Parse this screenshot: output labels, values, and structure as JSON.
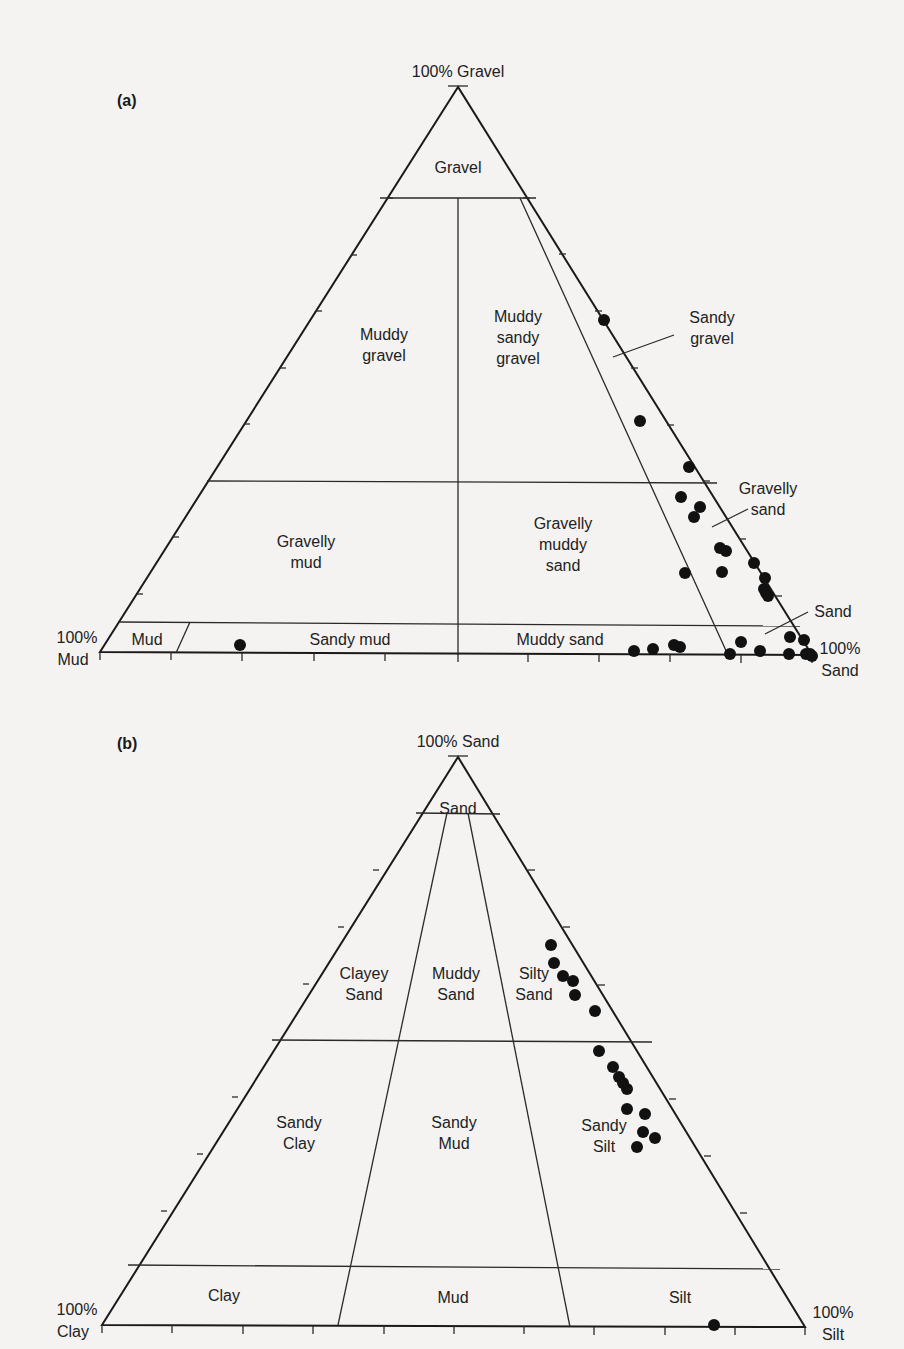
{
  "chart_data": [
    {
      "type": "ternary",
      "panel": "(a)",
      "title": "",
      "vertices": {
        "top": "100% Gravel",
        "bottom_left": [
          "100%",
          "Mud"
        ],
        "bottom_right": [
          "100%",
          "Sand"
        ]
      },
      "geometry": {
        "apex": [
          458,
          87
        ],
        "left": [
          100,
          652
        ],
        "right": [
          812,
          655
        ]
      },
      "boundaries_gravel_pct": [
        80,
        30,
        5
      ],
      "regions": [
        {
          "lines": [
            "Gravel"
          ],
          "x": 458,
          "y": 168
        },
        {
          "lines": [
            "Muddy",
            "gravel"
          ],
          "x": 384,
          "y": 345
        },
        {
          "lines": [
            "Muddy",
            "sandy",
            "gravel"
          ],
          "x": 518,
          "y": 338
        },
        {
          "lines": [
            "Sandy",
            "gravel"
          ],
          "x": 712,
          "y": 328,
          "leader": [
            [
              613,
              357
            ],
            [
              674,
              335
            ]
          ]
        },
        {
          "lines": [
            "Gravelly",
            "mud"
          ],
          "x": 306,
          "y": 552
        },
        {
          "lines": [
            "Gravelly",
            "muddy",
            "sand"
          ],
          "x": 563,
          "y": 545
        },
        {
          "lines": [
            "Gravelly",
            "sand"
          ],
          "x": 768,
          "y": 499,
          "leader": [
            [
              712,
              527
            ],
            [
              748,
              509
            ]
          ]
        },
        {
          "lines": [
            "Sand"
          ],
          "x": 833,
          "y": 612,
          "leader": [
            [
              765,
              634
            ],
            [
              808,
              612
            ]
          ]
        },
        {
          "lines": [
            "Mud"
          ],
          "x": 147,
          "y": 640
        },
        {
          "lines": [
            "Sandy mud"
          ],
          "x": 350,
          "y": 640
        },
        {
          "lines": [
            "Muddy sand"
          ],
          "x": 560,
          "y": 640
        }
      ],
      "points": [
        [
          604,
          320
        ],
        [
          640,
          421
        ],
        [
          689,
          467
        ],
        [
          681,
          497
        ],
        [
          700,
          507
        ],
        [
          694,
          517
        ],
        [
          720,
          548
        ],
        [
          726,
          551
        ],
        [
          685,
          573
        ],
        [
          722,
          572
        ],
        [
          754,
          563
        ],
        [
          765,
          578
        ],
        [
          764,
          589
        ],
        [
          766,
          593
        ],
        [
          768,
          596
        ],
        [
          240,
          645
        ],
        [
          634,
          651
        ],
        [
          653,
          649
        ],
        [
          674,
          645
        ],
        [
          680,
          647
        ],
        [
          730,
          654
        ],
        [
          741,
          642
        ],
        [
          760,
          651
        ],
        [
          790,
          637
        ],
        [
          789,
          654
        ],
        [
          804,
          640
        ],
        [
          806,
          654
        ],
        [
          810,
          654
        ],
        [
          812,
          656
        ]
      ]
    },
    {
      "type": "ternary",
      "panel": "(b)",
      "title": "",
      "vertices": {
        "top": "100% Sand",
        "bottom_left": [
          "100%",
          "Clay"
        ],
        "bottom_right": [
          "100%",
          "Silt"
        ]
      },
      "geometry": {
        "apex": [
          458,
          757
        ],
        "left": [
          102,
          1325
        ],
        "right": [
          805,
          1327
        ]
      },
      "boundaries_sand_pct": [
        90,
        50,
        10
      ],
      "silt_clay_ratio_boundaries": [
        "2:1 clay",
        "1:2 clay"
      ],
      "regions": [
        {
          "lines": [
            "Sand"
          ],
          "x": 458,
          "y": 809
        },
        {
          "lines": [
            "Clayey",
            "Sand"
          ],
          "x": 364,
          "y": 984
        },
        {
          "lines": [
            "Muddy",
            "Sand"
          ],
          "x": 456,
          "y": 984
        },
        {
          "lines": [
            "Silty",
            "Sand"
          ],
          "x": 534,
          "y": 984
        },
        {
          "lines": [
            "Sandy",
            "Clay"
          ],
          "x": 299,
          "y": 1133
        },
        {
          "lines": [
            "Sandy",
            "Mud"
          ],
          "x": 454,
          "y": 1133
        },
        {
          "lines": [
            "Sandy",
            "Silt"
          ],
          "x": 604,
          "y": 1136
        },
        {
          "lines": [
            "Clay"
          ],
          "x": 224,
          "y": 1296
        },
        {
          "lines": [
            "Mud"
          ],
          "x": 453,
          "y": 1298
        },
        {
          "lines": [
            "Silt"
          ],
          "x": 680,
          "y": 1298
        }
      ],
      "points": [
        [
          551,
          945
        ],
        [
          554,
          963
        ],
        [
          563,
          976
        ],
        [
          573,
          981
        ],
        [
          575,
          995
        ],
        [
          595,
          1011
        ],
        [
          599,
          1051
        ],
        [
          613,
          1067
        ],
        [
          619,
          1077
        ],
        [
          623,
          1083
        ],
        [
          627,
          1089
        ],
        [
          627,
          1109
        ],
        [
          645,
          1114
        ],
        [
          643,
          1132
        ],
        [
          655,
          1138
        ],
        [
          637,
          1147
        ],
        [
          714,
          1325
        ]
      ]
    }
  ]
}
